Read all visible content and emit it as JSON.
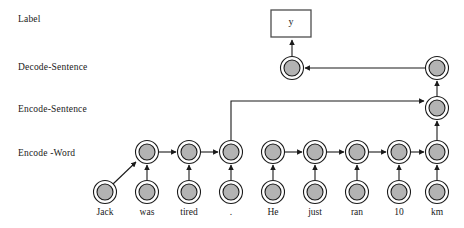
{
  "figure": {
    "type": "hierarchical-encoder-decoder-diagram",
    "background": "#ffffff",
    "node_fill": "#b3b3b3",
    "node_ring": "#ffffff",
    "stroke": "#1a1a1a",
    "box_stroke": "#4d4d4d"
  },
  "row_labels": [
    {
      "id": "label",
      "text": "Label",
      "x": 18,
      "y": 14
    },
    {
      "id": "decode-sentence",
      "text": "Decode-Sentence",
      "x": 18,
      "y": 62
    },
    {
      "id": "encode-sentence",
      "text": "Encode-Sentence",
      "x": 18,
      "y": 104
    },
    {
      "id": "encode-word",
      "text": "Encode -Word",
      "x": 18,
      "y": 148
    }
  ],
  "output_box": {
    "text": "y",
    "x": 271,
    "y": 10,
    "w": 40,
    "h": 27
  },
  "words": [
    {
      "text": "Jack",
      "cx": 105
    },
    {
      "text": "was",
      "cx": 147
    },
    {
      "text": "tired",
      "cx": 189
    },
    {
      "text": ".",
      "cx": 231
    },
    {
      "text": "He",
      "cx": 273
    },
    {
      "text": "just",
      "cx": 315
    },
    {
      "text": "ran",
      "cx": 357
    },
    {
      "text": "10",
      "cx": 399
    },
    {
      "text": "km",
      "cx": 437
    }
  ],
  "rows": {
    "word_cy": 192,
    "encode_word_cy": 152,
    "encode_sentence_cy": 108,
    "decode_cy": 68
  },
  "encode_word_nodes": [
    147,
    189,
    231,
    273,
    315,
    357,
    399,
    437
  ],
  "encode_sentence_nodes": [
    437
  ],
  "decode_nodes": [
    292,
    437
  ],
  "node_radius": {
    "outer": 11.5,
    "inner": 8.0
  },
  "connections": [
    {
      "from": "word-Jack",
      "to": "encode-word-was",
      "kind": "diagonal"
    },
    {
      "from": "word-was",
      "to": "encode-word-was",
      "kind": "vertical"
    },
    {
      "from": "word-tired",
      "to": "encode-word-tired",
      "kind": "vertical"
    },
    {
      "from": "word-dot",
      "to": "encode-word-dot",
      "kind": "vertical"
    },
    {
      "from": "word-He",
      "to": "encode-word-He",
      "kind": "vertical"
    },
    {
      "from": "word-just",
      "to": "encode-word-just",
      "kind": "vertical"
    },
    {
      "from": "word-ran",
      "to": "encode-word-ran",
      "kind": "vertical"
    },
    {
      "from": "word-10",
      "to": "encode-word-10",
      "kind": "vertical"
    },
    {
      "from": "word-km",
      "to": "encode-word-km",
      "kind": "vertical"
    },
    {
      "from": "encode-word-was",
      "to": "encode-word-tired",
      "kind": "horizontal"
    },
    {
      "from": "encode-word-tired",
      "to": "encode-word-dot",
      "kind": "horizontal"
    },
    {
      "from": "encode-word-He",
      "to": "encode-word-just",
      "kind": "horizontal"
    },
    {
      "from": "encode-word-just",
      "to": "encode-word-ran",
      "kind": "horizontal"
    },
    {
      "from": "encode-word-ran",
      "to": "encode-word-10",
      "kind": "horizontal"
    },
    {
      "from": "encode-word-10",
      "to": "encode-word-km",
      "kind": "horizontal"
    },
    {
      "from": "encode-word-dot",
      "to": "encode-sentence-km",
      "kind": "elbow-up-right"
    },
    {
      "from": "encode-word-km",
      "to": "encode-sentence-km",
      "kind": "vertical"
    },
    {
      "from": "encode-sentence-km",
      "to": "decode-km",
      "kind": "vertical"
    },
    {
      "from": "decode-km",
      "to": "decode-main",
      "kind": "horizontal-left"
    },
    {
      "from": "decode-main",
      "to": "output-box-y",
      "kind": "vertical"
    }
  ]
}
